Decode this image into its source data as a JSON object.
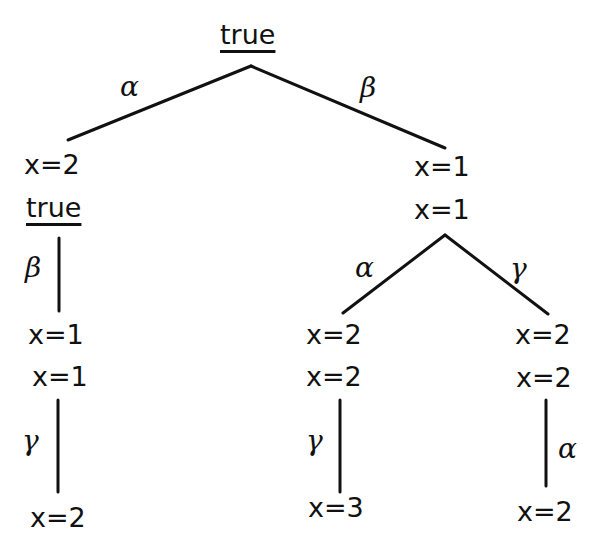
{
  "diagram": {
    "type": "execution-tree",
    "root": {
      "label": "true",
      "underlined": true
    },
    "nodes": {
      "n_left": {
        "lines": [
          "x=2",
          "true"
        ],
        "underlined_line": 1
      },
      "n_right": {
        "lines": [
          "x=1",
          "x=1"
        ]
      },
      "n_left_2": {
        "lines": [
          "x=1",
          "x=1"
        ]
      },
      "n_left_3": {
        "lines": [
          "x=2"
        ]
      },
      "n_rl": {
        "lines": [
          "x=2",
          "x=2"
        ]
      },
      "n_rl_2": {
        "lines": [
          "x=3"
        ]
      },
      "n_rr": {
        "lines": [
          "x=2",
          "x=2"
        ]
      },
      "n_rr_2": {
        "lines": [
          "x=2"
        ]
      }
    },
    "edges": [
      {
        "from": "root",
        "to": "n_left",
        "label": "α"
      },
      {
        "from": "root",
        "to": "n_right",
        "label": "β"
      },
      {
        "from": "n_left",
        "to": "n_left_2",
        "label": "β"
      },
      {
        "from": "n_left_2",
        "to": "n_left_3",
        "label": "γ"
      },
      {
        "from": "n_right",
        "to": "n_rl",
        "label": "α"
      },
      {
        "from": "n_right",
        "to": "n_rr",
        "label": "γ"
      },
      {
        "from": "n_rl",
        "to": "n_rl_2",
        "label": "γ"
      },
      {
        "from": "n_rr",
        "to": "n_rr_2",
        "label": "α"
      }
    ]
  },
  "text": {
    "root": "true",
    "left_line1": "x=2",
    "left_line2": "true",
    "right_line1": "x=1",
    "right_line2": "x=1",
    "left2_line1": "x=1",
    "left2_line2": "x=1",
    "left3_line1": "x=2",
    "rl_line1": "x=2",
    "rl_line2": "x=2",
    "rl2_line1": "x=3",
    "rr_line1": "x=2",
    "rr_line2": "x=2",
    "rr2_line1": "x=2",
    "edge_root_left": "α",
    "edge_root_right": "β",
    "edge_left_down": "β",
    "edge_left2_down": "γ",
    "edge_right_left": "α",
    "edge_right_right": "γ",
    "edge_rl_down": "γ",
    "edge_rr_down": "α"
  }
}
